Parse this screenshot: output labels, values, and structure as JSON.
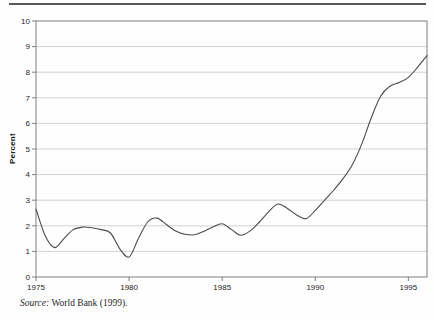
{
  "page": {
    "background": "#fefefe",
    "top_rule_color": "#58585c"
  },
  "chart": {
    "axis_color": "#7e7e7e",
    "grid_color": "#c3c3c3",
    "line_color": "#4a4a4a",
    "tick_text_color": "#262626"
  },
  "source_note": {
    "label": "Source:",
    "text": " World Bank (1999)."
  },
  "chart_data": {
    "type": "line",
    "title": "",
    "xlabel": "",
    "ylabel": "Percent",
    "xlim": [
      1975,
      1996
    ],
    "ylim": [
      0,
      10
    ],
    "xticks": [
      1975,
      1980,
      1985,
      1990,
      1995
    ],
    "yticks": [
      0,
      1,
      2,
      3,
      4,
      5,
      6,
      7,
      8,
      9,
      10
    ],
    "grid": "horizontal",
    "legend": "none",
    "x": [
      1975,
      1975.5,
      1976,
      1976.5,
      1977,
      1977.5,
      1978,
      1978.5,
      1979,
      1979.5,
      1980,
      1980.5,
      1981,
      1981.5,
      1982,
      1982.5,
      1983,
      1983.5,
      1984,
      1984.5,
      1985,
      1985.5,
      1986,
      1986.5,
      1987,
      1987.5,
      1988,
      1988.5,
      1989,
      1989.5,
      1990,
      1990.5,
      1991,
      1991.5,
      1992,
      1992.5,
      1993,
      1993.5,
      1994,
      1994.5,
      1995,
      1995.5,
      1996
    ],
    "y": [
      2.65,
      1.6,
      1.15,
      1.5,
      1.85,
      1.95,
      1.92,
      1.85,
      1.72,
      1.1,
      0.78,
      1.5,
      2.15,
      2.3,
      2.05,
      1.8,
      1.67,
      1.65,
      1.78,
      1.95,
      2.08,
      1.85,
      1.63,
      1.8,
      2.15,
      2.55,
      2.85,
      2.68,
      2.42,
      2.28,
      2.6,
      3.0,
      3.4,
      3.85,
      4.4,
      5.2,
      6.2,
      7.05,
      7.45,
      7.6,
      7.8,
      8.2,
      8.65
    ]
  }
}
